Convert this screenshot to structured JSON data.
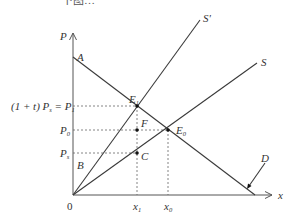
{
  "caption_partial": "下图…",
  "axes": {
    "y_label": "P",
    "x_label": "x",
    "origin_label": "0"
  },
  "curves": {
    "demand": "D",
    "supply": "S",
    "supply_taxed": "S'"
  },
  "points": {
    "A": "A",
    "B": "B",
    "C": "C",
    "F": "F",
    "E1": {
      "base": "E",
      "sub": "1"
    },
    "E0": {
      "base": "E",
      "sub": "0"
    }
  },
  "y_ticks": {
    "p1_prefix": "(1 + t) P",
    "p1_prefix_sub": "s",
    "p1_eq": " = P",
    "p1_sub": "1",
    "p0": "P",
    "p0_sub": "0",
    "ps": "P",
    "ps_sub": "s"
  },
  "x_ticks": {
    "x1": {
      "base": "x",
      "sub": "1"
    },
    "x0": {
      "base": "x",
      "sub": "0"
    }
  },
  "geometry": {
    "origin": [
      73,
      195
    ],
    "demand_line": [
      [
        73,
        57
      ],
      [
        255,
        195
      ]
    ],
    "supply_taxed_line": [
      [
        73,
        195
      ],
      [
        200,
        20
      ]
    ],
    "supply_line": [
      [
        73,
        195
      ],
      [
        257,
        63
      ]
    ],
    "E1": [
      137,
      106
    ],
    "E0": [
      168,
      130
    ],
    "F": [
      137,
      130
    ],
    "C": [
      137,
      153
    ]
  }
}
